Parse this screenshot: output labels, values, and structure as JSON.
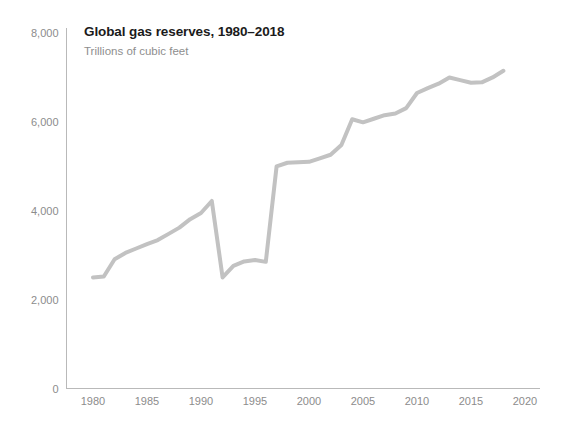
{
  "chart_data": {
    "type": "line",
    "title": "Global gas reserves, 1980–2018",
    "subtitle": "Trillions of cubic feet",
    "xlabel": "",
    "ylabel": "",
    "ylim": [
      0,
      8000
    ],
    "xlim": [
      1978,
      2022
    ],
    "grid": false,
    "legend": false,
    "line_color": "#c2c2c2",
    "line_width": 4,
    "axis_color": "#b9b9b9",
    "tick_label_color": "#8c8c8c",
    "title_color": "#1b1b1b",
    "subtitle_color": "#8e8e8e",
    "y_ticks": [
      0,
      2000,
      4000,
      6000,
      8000
    ],
    "y_tick_labels": [
      "0",
      "2,000",
      "4,000",
      "6,000",
      "8,000"
    ],
    "x_ticks": [
      1980,
      1985,
      1990,
      1995,
      2000,
      2005,
      2010,
      2015,
      2020
    ],
    "x_tick_labels": [
      "1980",
      "1985",
      "1990",
      "1995",
      "2000",
      "2005",
      "2010",
      "2015",
      "2020"
    ],
    "x": [
      1980,
      1981,
      1982,
      1983,
      1984,
      1985,
      1986,
      1987,
      1988,
      1989,
      1990,
      1991,
      1992,
      1993,
      1994,
      1995,
      1996,
      1997,
      1998,
      1999,
      2000,
      2001,
      2002,
      2003,
      2004,
      2005,
      2006,
      2007,
      2008,
      2009,
      2010,
      2011,
      2012,
      2013,
      2014,
      2015,
      2016,
      2017,
      2018
    ],
    "series": [
      {
        "name": "Global gas reserves",
        "values": [
          2500,
          2520,
          2910,
          3050,
          3150,
          3250,
          3340,
          3480,
          3620,
          3810,
          3950,
          4220,
          2500,
          2760,
          2860,
          2890,
          2850,
          5000,
          5080,
          5090,
          5100,
          5180,
          5260,
          5480,
          6060,
          5990,
          6070,
          6150,
          6190,
          6310,
          6650,
          6760,
          6860,
          7000,
          6940,
          6880,
          6890,
          7000,
          7150
        ]
      }
    ]
  }
}
